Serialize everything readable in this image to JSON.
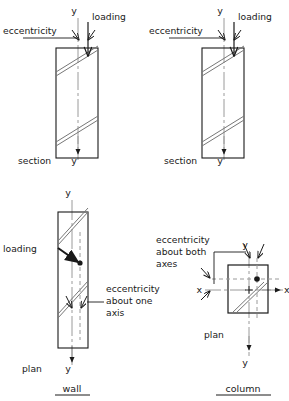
{
  "figure": {
    "stroke_color": "#1a1a1a",
    "hatch_color": "#6e6e6e",
    "centerline_color": "#9a9a9a",
    "background": "#ffffff"
  },
  "panels": [
    {
      "id": "wall-section",
      "position": "top-left",
      "view": "section",
      "labels": {
        "axis_top": "y",
        "axis_bottom": "y",
        "eccentricity": "eccentricity",
        "loading": "loading",
        "view_name": "section"
      }
    },
    {
      "id": "column-section",
      "position": "top-right",
      "view": "section",
      "labels": {
        "axis_top": "y",
        "axis_bottom": "y",
        "eccentricity": "eccentricity",
        "loading": "loading",
        "view_name": "section"
      }
    },
    {
      "id": "wall-plan",
      "position": "bottom-left",
      "view": "plan",
      "labels": {
        "axis_top": "y",
        "axis_bottom": "y",
        "loading": "loading",
        "eccentricity_line1": "eccentricity",
        "eccentricity_line2": "about one",
        "eccentricity_line3": "axis",
        "view_name": "plan",
        "caption": "wall"
      }
    },
    {
      "id": "column-plan",
      "position": "bottom-right",
      "view": "plan",
      "labels": {
        "axis_top": "y",
        "axis_bottom": "y",
        "axis_left": "x",
        "axis_right": "x",
        "eccentricity_line1": "eccentricity",
        "eccentricity_line2": "about both",
        "eccentricity_line3": "axes",
        "view_name": "plan",
        "caption": "column"
      }
    }
  ]
}
